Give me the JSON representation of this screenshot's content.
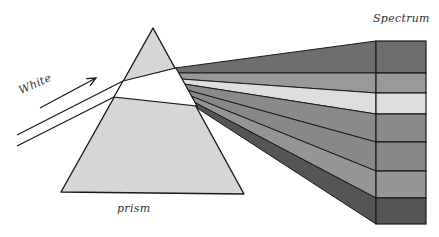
{
  "labels": {
    "white": "White",
    "prism": "prism",
    "spectrum": "Spectrum"
  },
  "colors": {
    "prism_fill": "#d6d6d6",
    "beam_inside": "#ffffff",
    "outline": "#1a1a1a",
    "bands": [
      "#6e6e6e",
      "#999999",
      "#dedede",
      "#8a8a8a",
      "#888888",
      "#959595",
      "#555555"
    ]
  },
  "geometry": {
    "prism": {
      "apex": [
        153,
        28
      ],
      "base_left": [
        61,
        192
      ],
      "base_right": [
        244,
        194
      ]
    },
    "beam": {
      "upper": {
        "start": [
          17,
          135
        ],
        "enter": [
          123,
          81
        ],
        "exit": [
          176,
          68
        ]
      },
      "lower": {
        "start": [
          17,
          146
        ],
        "enter": [
          114,
          97
        ],
        "exit": [
          197,
          106
        ]
      }
    },
    "arrow": {
      "start": [
        40,
        108
      ],
      "end": [
        96,
        78
      ]
    },
    "fan_origins_y": [
      68,
      73,
      79,
      84,
      90,
      96,
      102,
      108
    ],
    "fan_origins_x": [
      175,
      178,
      181,
      184,
      187,
      191,
      194,
      197
    ],
    "spectrum_x_front": 376,
    "spectrum_x_back": 426,
    "spectrum_band_y": [
      41,
      73,
      93,
      114,
      142,
      171,
      198,
      224
    ]
  }
}
